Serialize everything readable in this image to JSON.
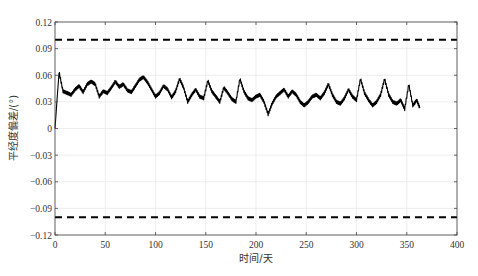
{
  "chart_data": {
    "type": "line",
    "title": "",
    "xlabel": "时间/天",
    "ylabel": "平经度偏差/(°)",
    "xlim": [
      0,
      400
    ],
    "ylim": [
      -0.12,
      0.12
    ],
    "xticks": [
      0,
      50,
      100,
      150,
      200,
      250,
      300,
      350,
      400
    ],
    "yticks": [
      -0.12,
      -0.09,
      -0.06,
      -0.03,
      0,
      0.03,
      0.06,
      0.09,
      0.12
    ],
    "xtick_labels": [
      "0",
      "50",
      "100",
      "150",
      "200",
      "250",
      "300",
      "350",
      "400"
    ],
    "ytick_labels": [
      "-0.12",
      "-0.09",
      "-0.06",
      "-0.03",
      "0",
      "0.03",
      "0.06",
      "0.09",
      "0.12"
    ],
    "grid": true,
    "legend": null,
    "series": [
      {
        "name": "mean longitude deviation",
        "style": "solid",
        "color": "#000000",
        "x": [
          0,
          4,
          8,
          12,
          16,
          20,
          24,
          28,
          32,
          36,
          40,
          44,
          48,
          52,
          56,
          60,
          64,
          68,
          72,
          76,
          80,
          84,
          88,
          92,
          96,
          100,
          104,
          108,
          112,
          116,
          120,
          124,
          128,
          132,
          136,
          140,
          144,
          148,
          152,
          156,
          160,
          164,
          168,
          172,
          176,
          180,
          184,
          188,
          192,
          196,
          200,
          204,
          208,
          212,
          216,
          220,
          224,
          228,
          232,
          236,
          240,
          244,
          248,
          252,
          256,
          260,
          264,
          268,
          272,
          276,
          280,
          284,
          288,
          292,
          296,
          300,
          304,
          308,
          312,
          316,
          320,
          324,
          328,
          332,
          336,
          340,
          344,
          348,
          352,
          356,
          360,
          363
        ],
        "y": [
          0.0,
          0.064,
          0.042,
          0.04,
          0.038,
          0.044,
          0.048,
          0.041,
          0.05,
          0.053,
          0.05,
          0.036,
          0.042,
          0.04,
          0.046,
          0.053,
          0.047,
          0.05,
          0.043,
          0.041,
          0.048,
          0.055,
          0.058,
          0.052,
          0.044,
          0.036,
          0.04,
          0.048,
          0.044,
          0.035,
          0.042,
          0.056,
          0.046,
          0.03,
          0.038,
          0.044,
          0.036,
          0.034,
          0.054,
          0.042,
          0.036,
          0.03,
          0.046,
          0.04,
          0.033,
          0.03,
          0.056,
          0.042,
          0.034,
          0.032,
          0.036,
          0.038,
          0.03,
          0.016,
          0.028,
          0.036,
          0.04,
          0.044,
          0.036,
          0.042,
          0.038,
          0.03,
          0.026,
          0.03,
          0.036,
          0.038,
          0.034,
          0.04,
          0.05,
          0.038,
          0.03,
          0.028,
          0.034,
          0.044,
          0.036,
          0.032,
          0.056,
          0.04,
          0.032,
          0.026,
          0.03,
          0.038,
          0.056,
          0.038,
          0.03,
          0.028,
          0.032,
          0.022,
          0.05,
          0.026,
          0.032,
          0.023
        ]
      },
      {
        "name": "upper bound",
        "style": "dashed",
        "color": "#000000",
        "x": [
          0,
          400
        ],
        "y": [
          0.1,
          0.1
        ]
      },
      {
        "name": "lower bound",
        "style": "dashed",
        "color": "#000000",
        "x": [
          0,
          400
        ],
        "y": [
          -0.1,
          -0.1
        ]
      }
    ]
  }
}
